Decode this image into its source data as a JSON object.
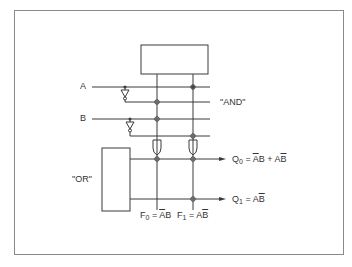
{
  "diagram": {
    "type": "PLA logic circuit",
    "inputs": [
      {
        "label": "A"
      },
      {
        "label": "B"
      }
    ],
    "planes": {
      "and_label": "\"AND\"",
      "or_label": "\"OR\""
    },
    "product_terms": [
      {
        "name": "F",
        "index": "0",
        "eq": " = ",
        "expr_bar": "A",
        "expr_rest": "B"
      },
      {
        "name": "F",
        "index": "1",
        "eq": " = ",
        "expr_plain": "A",
        "expr_bar": "B"
      }
    ],
    "outputs": [
      {
        "name": "Q",
        "index": "0",
        "eq": " = ",
        "t1_bar": "A",
        "t1_rest": "B",
        "plus": " + ",
        "t2_plain": "A",
        "t2_bar": "B"
      },
      {
        "name": "Q",
        "index": "1",
        "eq": " = ",
        "t_plain": "A",
        "t_bar": "B"
      }
    ],
    "colors": {
      "line": "#3a3a3a",
      "frame": "#8a8a8a",
      "background": "#ffffff"
    }
  }
}
